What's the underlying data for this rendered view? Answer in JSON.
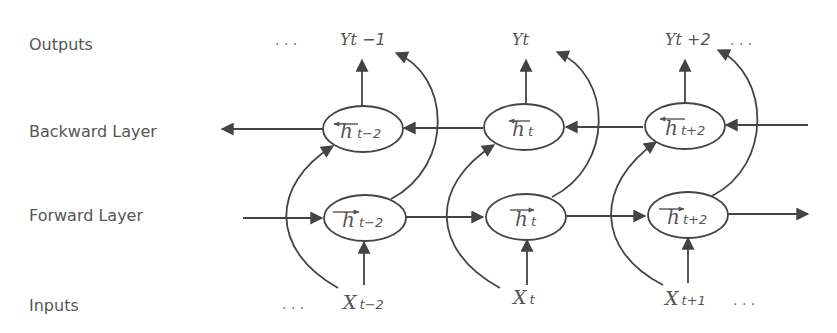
{
  "row_labels": {
    "outputs": "Outputs",
    "backward": "Backward Layer",
    "forward": "Forward Layer",
    "inputs": "Inputs"
  },
  "outputs": [
    {
      "base": "Yt",
      "suffix": " −1"
    },
    {
      "base": "Yt",
      "suffix": ""
    },
    {
      "base": "Yt",
      "suffix": " +2"
    }
  ],
  "backward_nodes": [
    {
      "base": "h",
      "sub": "t−2",
      "arrow": "left"
    },
    {
      "base": "h",
      "sub": "t",
      "arrow": "left"
    },
    {
      "base": "h",
      "sub": "t+2",
      "arrow": "left"
    }
  ],
  "forward_nodes": [
    {
      "base": "h",
      "sub": "t−2",
      "arrow": "right"
    },
    {
      "base": "h",
      "sub": "t",
      "arrow": "right"
    },
    {
      "base": "h",
      "sub": "t+2",
      "arrow": "right"
    }
  ],
  "inputs": [
    {
      "base": "X",
      "sub": "t−2"
    },
    {
      "base": "X",
      "sub": "t"
    },
    {
      "base": "X",
      "sub": "t+1"
    }
  ],
  "ellipsis": ". . .",
  "colors": {
    "stroke": "#444444",
    "text": "#555555"
  }
}
